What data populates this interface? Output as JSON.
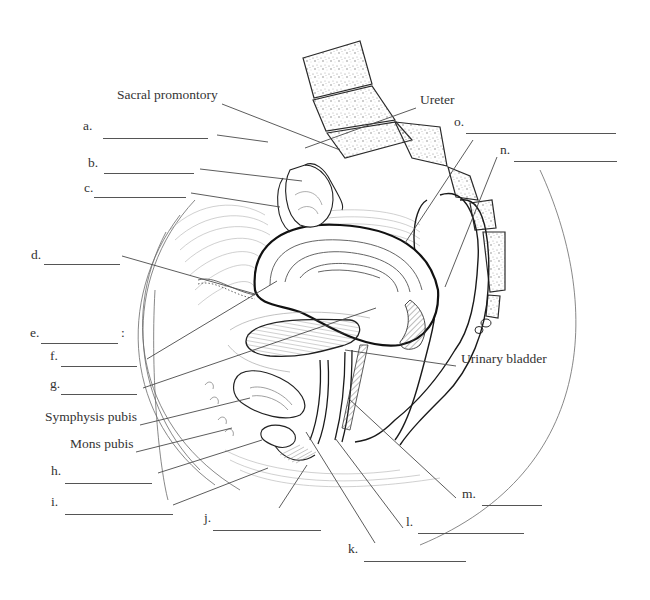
{
  "diagram": {
    "named_labels": [
      {
        "id": "sacral-promontory",
        "text": "Sacral promontory",
        "x": 117,
        "y": 95
      },
      {
        "id": "ureter",
        "text": "Ureter",
        "x": 420,
        "y": 100
      },
      {
        "id": "urinary-bladder",
        "text": "Urinary bladder",
        "x": 461,
        "y": 359
      },
      {
        "id": "symphysis-pubis",
        "text": "Symphysis pubis",
        "x": 45,
        "y": 417
      },
      {
        "id": "mons-pubis",
        "text": "Mons pubis",
        "x": 70,
        "y": 444
      }
    ],
    "blank_labels": [
      {
        "letter": "a.",
        "x": 83,
        "y": 126,
        "line_x": 103,
        "line_w": 105,
        "line_y": 138
      },
      {
        "letter": "b.",
        "x": 88,
        "y": 163,
        "line_x": 104,
        "line_w": 90,
        "line_y": 173
      },
      {
        "letter": "c.",
        "x": 84,
        "y": 188,
        "line_x": 94,
        "line_w": 92,
        "line_y": 197
      },
      {
        "letter": "d.",
        "x": 31,
        "y": 255,
        "line_x": 44,
        "line_w": 76,
        "line_y": 264
      },
      {
        "letter": "e.",
        "x": 30,
        "y": 333,
        "line_x": 41,
        "line_w": 77,
        "line_y": 343,
        "suffix": ":"
      },
      {
        "letter": "f.",
        "x": 50,
        "y": 356,
        "line_x": 61,
        "line_w": 76,
        "line_y": 366
      },
      {
        "letter": "g.",
        "x": 50,
        "y": 384,
        "line_x": 61,
        "line_w": 76,
        "line_y": 394
      },
      {
        "letter": "h.",
        "x": 51,
        "y": 471,
        "line_x": 65,
        "line_w": 87,
        "line_y": 483
      },
      {
        "letter": "i.",
        "x": 51,
        "y": 502,
        "line_x": 65,
        "line_w": 108,
        "line_y": 514
      },
      {
        "letter": "j.",
        "x": 204,
        "y": 518,
        "line_x": 213,
        "line_w": 108,
        "line_y": 530
      },
      {
        "letter": "k.",
        "x": 348,
        "y": 549,
        "line_x": 364,
        "line_w": 102,
        "line_y": 561
      },
      {
        "letter": "l.",
        "x": 406,
        "y": 522,
        "line_x": 418,
        "line_w": 106,
        "line_y": 533
      },
      {
        "letter": "m.",
        "x": 462,
        "y": 494,
        "line_x": 482,
        "line_w": 60,
        "line_y": 505
      },
      {
        "letter": "n.",
        "x": 500,
        "y": 150,
        "line_x": 514,
        "line_w": 103,
        "line_y": 161
      },
      {
        "letter": "o.",
        "x": 454,
        "y": 122,
        "line_x": 466,
        "line_w": 150,
        "line_y": 133
      }
    ],
    "leader_lines": [
      {
        "target": "sacral-promontory",
        "x1": 222,
        "y1": 104,
        "x2": 340,
        "y2": 150
      },
      {
        "target": "ureter",
        "x1": 416,
        "y1": 108,
        "x2": 305,
        "y2": 148
      },
      {
        "target": "a",
        "x1": 217,
        "y1": 135,
        "x2": 268,
        "y2": 142
      },
      {
        "target": "b",
        "x1": 200,
        "y1": 169,
        "x2": 302,
        "y2": 181
      },
      {
        "target": "c",
        "x1": 191,
        "y1": 193,
        "x2": 280,
        "y2": 207
      },
      {
        "target": "d",
        "x1": 122,
        "y1": 256,
        "x2": 255,
        "y2": 294
      },
      {
        "target": "f",
        "x1": 147,
        "y1": 359,
        "x2": 277,
        "y2": 281
      },
      {
        "target": "g",
        "x1": 143,
        "y1": 388,
        "x2": 376,
        "y2": 308
      },
      {
        "target": "symphysis-pubis",
        "x1": 140,
        "y1": 425,
        "x2": 250,
        "y2": 398
      },
      {
        "target": "mons-pubis",
        "x1": 136,
        "y1": 452,
        "x2": 232,
        "y2": 428
      },
      {
        "target": "h",
        "x1": 158,
        "y1": 473,
        "x2": 262,
        "y2": 440
      },
      {
        "target": "i",
        "x1": 173,
        "y1": 505,
        "x2": 268,
        "y2": 468
      },
      {
        "target": "j",
        "x1": 279,
        "y1": 508,
        "x2": 307,
        "y2": 465
      },
      {
        "target": "k",
        "x1": 375,
        "y1": 543,
        "x2": 306,
        "y2": 432
      },
      {
        "target": "l",
        "x1": 403,
        "y1": 528,
        "x2": 335,
        "y2": 438
      },
      {
        "target": "m",
        "x1": 456,
        "y1": 498,
        "x2": 348,
        "y2": 398
      },
      {
        "target": "n",
        "x1": 497,
        "y1": 157,
        "x2": 445,
        "y2": 287
      },
      {
        "target": "o",
        "x1": 473,
        "y1": 140,
        "x2": 405,
        "y2": 243
      },
      {
        "target": "urinary-bladder",
        "x1": 456,
        "y1": 366,
        "x2": 345,
        "y2": 350
      }
    ],
    "colors": {
      "line": "#4a4a4a",
      "organ_outline": "#1a1a1a",
      "bone_fill": "#f4f4f4",
      "bone_speckle": "#9a9a9a",
      "hatching": "#8c8c8c",
      "text": "#333333"
    }
  }
}
